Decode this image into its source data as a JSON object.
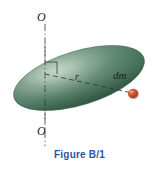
{
  "figure": {
    "caption": "Figure B/1",
    "caption_color": "#2b56a5",
    "background_color": "#ffffff",
    "axis": {
      "top_label": "O",
      "bottom_label": "O",
      "line_style": "dash-dot",
      "line_color": "#4a4a4a",
      "orientation": "vertical"
    },
    "body": {
      "shape": "ellipsoid",
      "fill_color": "#5d8670",
      "edge_color": "#3d6450",
      "highlight_color": "#9ab8a4",
      "rotation_deg": -17
    },
    "radius": {
      "label": "r",
      "line_style": "dashed",
      "line_color": "#3a3a3a"
    },
    "mass_element": {
      "label": "dm",
      "dot_color": "#c94a30",
      "dot_edge_color": "#8d2f1c"
    },
    "right_angle_marker": {
      "label": "right-angle",
      "color": "#3a3a3a"
    }
  }
}
